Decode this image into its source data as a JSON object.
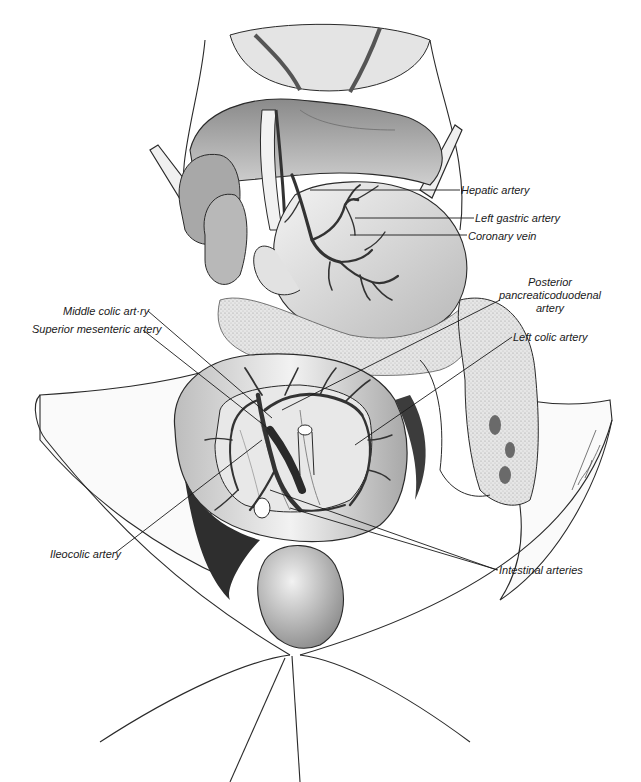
{
  "figure": {
    "colors": {
      "line": "#2a2a2a",
      "vessel": "#3a3a3a",
      "shade_dark": "#4a4a4a",
      "shade_mid": "#9a9a9a",
      "shade_light": "#d8d8d8",
      "background": "#ffffff"
    },
    "labels": [
      {
        "id": "hepatic-artery",
        "text": "Hepatic artery",
        "x": 461,
        "y": 184
      },
      {
        "id": "left-gastric-artery",
        "text": "Left gastric artery",
        "x": 475,
        "y": 212
      },
      {
        "id": "coronary-vein",
        "text": "Coronary vein",
        "x": 468,
        "y": 230
      },
      {
        "id": "posterior-pancreaticoduodenal-artery",
        "lines": [
          "Posterior",
          "pancreaticoduodenal",
          "artery"
        ],
        "x": 494,
        "y": 276
      },
      {
        "id": "left-colic-artery",
        "text": "Left colic artery",
        "x": 513,
        "y": 331
      },
      {
        "id": "middle-colic-artery",
        "text": "Middle colic art·ry",
        "x": 63,
        "y": 305
      },
      {
        "id": "superior-mesenteric-artery",
        "text": "Superior mesenteric artery",
        "x": 32,
        "y": 323
      },
      {
        "id": "ileocolic-artery",
        "text": "Ileocolic artery",
        "x": 50,
        "y": 548
      },
      {
        "id": "intestinal-arteries",
        "text": "Intestinal arteries",
        "x": 499,
        "y": 564
      }
    ],
    "signature": "artist signature (illegible)"
  }
}
